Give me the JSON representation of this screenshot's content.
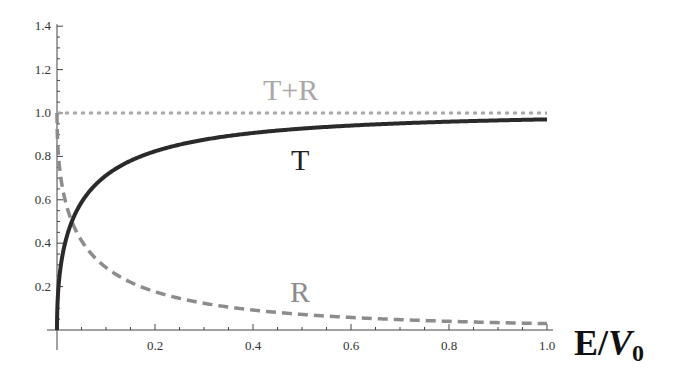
{
  "chart_data": {
    "type": "line",
    "title": "",
    "xlabel": "E/V0",
    "xlabel_main": "E/",
    "xlabel_var": "V",
    "xlabel_sub": "0",
    "ylabel": "",
    "xlim": [
      0,
      1.0
    ],
    "ylim": [
      0,
      1.4
    ],
    "grid": false,
    "legend": "inline labels",
    "x_ticks": [
      "0.2",
      "0.4",
      "0.6",
      "0.8",
      "1.0"
    ],
    "y_ticks": [
      "0.2",
      "0.4",
      "0.6",
      "0.8",
      "1.0",
      "1.2",
      "1.4"
    ],
    "x": [
      0.0,
      0.01,
      0.02,
      0.03,
      0.05,
      0.1,
      0.2,
      0.3,
      0.4,
      0.5,
      0.6,
      0.7,
      0.8,
      0.9,
      1.0
    ],
    "series": [
      {
        "name": "T",
        "label": "T",
        "style": "solid",
        "color": "#2a2a2a",
        "values": [
          0.0,
          0.34,
          0.44,
          0.5,
          0.58,
          0.7,
          0.8,
          0.86,
          0.89,
          0.92,
          0.93,
          0.95,
          0.96,
          0.96,
          0.97
        ]
      },
      {
        "name": "R",
        "label": "R",
        "style": "dashed",
        "color": "#8c8c8c",
        "values": [
          1.0,
          0.66,
          0.56,
          0.5,
          0.42,
          0.3,
          0.2,
          0.14,
          0.11,
          0.08,
          0.07,
          0.05,
          0.04,
          0.04,
          0.03
        ]
      },
      {
        "name": "T+R",
        "label": "T+R",
        "style": "dotted",
        "color": "#a8a8a8",
        "values": [
          1.0,
          1.0,
          1.0,
          1.0,
          1.0,
          1.0,
          1.0,
          1.0,
          1.0,
          1.0,
          1.0,
          1.0,
          1.0,
          1.0,
          1.0
        ]
      }
    ]
  }
}
